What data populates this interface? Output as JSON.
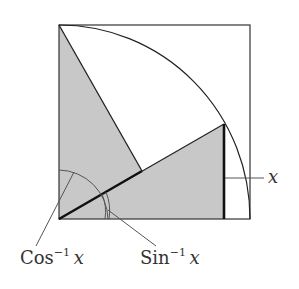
{
  "diagram": {
    "type": "unit-circle-inverse-trig",
    "labels": {
      "x_side": "x",
      "cos_inv": {
        "fn": "Cos",
        "exp": "−1",
        "var": "x"
      },
      "sin_inv": {
        "fn": "Sin",
        "exp": "−1",
        "var": "x"
      }
    },
    "colors": {
      "shade": "#c8c8c8",
      "stroke": "#222222",
      "background": "#ffffff"
    },
    "geometry": {
      "square": {
        "x": 59,
        "y": 25,
        "size": 193
      },
      "origin": [
        59,
        219
      ],
      "radius": 190,
      "arc_point": [
        224,
        124
      ],
      "perp_foot": [
        142,
        171
      ]
    }
  }
}
